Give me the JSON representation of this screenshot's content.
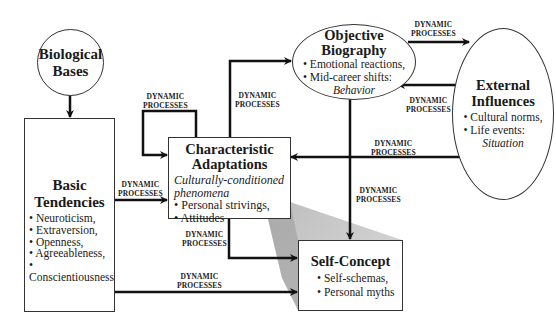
{
  "diagram": {
    "edge_label": "DYNAMIC\nPROCESSES",
    "edge_label_line1": "DYNAMIC",
    "edge_label_line2": "PROCESSES",
    "nodes": {
      "biological_bases": {
        "title_line1": "Biological",
        "title_line2": "Bases"
      },
      "basic_tendencies": {
        "title_line1": "Basic",
        "title_line2": "Tendencies",
        "items": [
          "• Neuroticism,",
          "• Extraversion,",
          "• Openness,",
          "• Agreeableness,",
          "• Conscientiousness"
        ]
      },
      "characteristic_adaptations": {
        "title_line1": "Characteristic",
        "title_line2": "Adaptations",
        "subtitle_line1": "Culturally-conditioned",
        "subtitle_line2": "phenomena",
        "items": [
          "• Personal strivings,",
          "• Attitudes"
        ]
      },
      "objective_biography": {
        "title_line1": "Objective",
        "title_line2": "Biography",
        "items": [
          "• Emotional reactions,",
          "• Mid-career shifts:"
        ],
        "tag": "Behavior"
      },
      "external_influences": {
        "title_line1": "External",
        "title_line2": "Influences",
        "items": [
          "• Cultural norms,",
          "• Life events:"
        ],
        "tag": "Situation"
      },
      "self_concept": {
        "title": "Self-Concept",
        "items": [
          "• Self-schemas,",
          "• Personal myths"
        ]
      }
    },
    "edges": [
      {
        "from": "Biological Bases",
        "to": "Basic Tendencies",
        "label": ""
      },
      {
        "from": "Basic Tendencies",
        "to": "Characteristic Adaptations",
        "label": "DYNAMIC PROCESSES"
      },
      {
        "from": "Characteristic Adaptations",
        "to": "Characteristic Adaptations",
        "label": "DYNAMIC PROCESSES"
      },
      {
        "from": "Characteristic Adaptations",
        "to": "Objective Biography",
        "label": "DYNAMIC PROCESSES"
      },
      {
        "from": "Objective Biography",
        "to": "External Influences",
        "label": "DYNAMIC PROCESSES"
      },
      {
        "from": "External Influences",
        "to": "Objective Biography",
        "label": "DYNAMIC PROCESSES"
      },
      {
        "from": "External Influences",
        "to": "Characteristic Adaptations",
        "label": "DYNAMIC PROCESSES"
      },
      {
        "from": "Objective Biography",
        "to": "Self-Concept",
        "label": "DYNAMIC PROCESSES"
      },
      {
        "from": "Characteristic Adaptations",
        "to": "Self-Concept",
        "label": "DYNAMIC PROCESSES"
      },
      {
        "from": "Basic Tendencies",
        "to": "Self-Concept",
        "label": "DYNAMIC PROCESSES"
      }
    ]
  }
}
